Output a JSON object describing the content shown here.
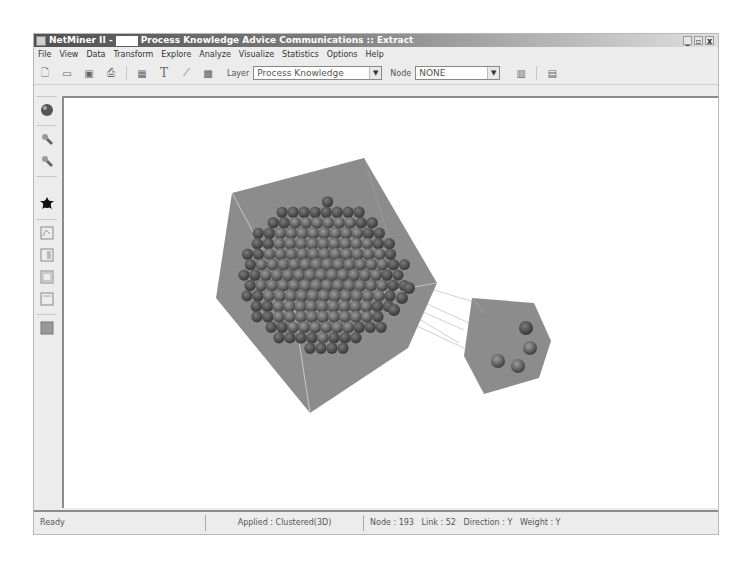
{
  "window": {
    "title_prefix": "NetMiner II -",
    "title_main": "Process Knowledge Advice Communications :: Extract",
    "controls": {
      "minimize": "_",
      "restore": "▫",
      "close": "x"
    }
  },
  "menubar": {
    "items": [
      "File",
      "View",
      "Data",
      "Transform",
      "Explore",
      "Analyze",
      "Visualize",
      "Statistics",
      "Options",
      "Help"
    ]
  },
  "toolbar": {
    "buttons": [
      {
        "name": "new-file-icon",
        "glyph": "🗋"
      },
      {
        "name": "open-folder-icon",
        "glyph": "▭"
      },
      {
        "name": "save-icon",
        "glyph": "▣"
      },
      {
        "name": "print-icon",
        "glyph": "⎙"
      },
      {
        "name": "grid-icon",
        "glyph": "▦"
      },
      {
        "name": "text-icon",
        "glyph": "T"
      },
      {
        "name": "link-icon",
        "glyph": "⟋"
      },
      {
        "name": "image-icon",
        "glyph": "▩"
      }
    ],
    "layer_label": "Layer",
    "layer_value": "Process Knowledge",
    "node_label": "Node",
    "node_value": "NONE",
    "dropdown_arrow": "▼",
    "right_buttons": [
      {
        "name": "columns-icon",
        "glyph": "▥"
      },
      {
        "name": "panel-icon",
        "glyph": "▤"
      }
    ]
  },
  "left_toolbar": {
    "buttons": [
      "sphere-icon",
      "zoom-in-icon",
      "zoom-out-icon",
      "node-star-icon",
      "frame-1-icon",
      "frame-2-icon",
      "frame-3-icon",
      "frame-4-icon",
      "fill-icon"
    ]
  },
  "visualization": {
    "layout": "Clustered(3D)",
    "clusters": [
      {
        "name": "large-cluster",
        "node_count_visible": 189,
        "labels_visible": true
      },
      {
        "name": "small-cluster",
        "node_count_visible": 4
      }
    ],
    "colors": {
      "cube": "#8a8a8a",
      "node": "#6e6e6e",
      "edge": "#d8d8d8"
    }
  },
  "statusbar": {
    "status": "Ready",
    "applied": "Applied : Clustered(3D)",
    "stats": "Node : 193   Link : 52   Direction : Y   Weight : Y"
  }
}
